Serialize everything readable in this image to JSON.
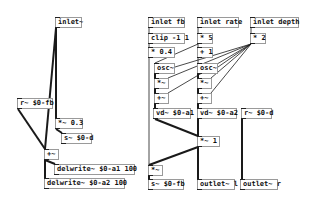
{
  "patch": {
    "objects": [
      {
        "id": "inlet_sig",
        "label": "inlet~",
        "x": 55,
        "y": 17,
        "w": 27
      },
      {
        "id": "r_fb",
        "label": "r~ $0-fb",
        "x": 17,
        "y": 98,
        "w": 36
      },
      {
        "id": "mul_03",
        "label": "*~ 0.3",
        "x": 55,
        "y": 118,
        "w": 28
      },
      {
        "id": "s_d",
        "label": "s~ $0-d",
        "x": 61,
        "y": 133,
        "w": 31
      },
      {
        "id": "add_left",
        "label": "+~",
        "x": 44,
        "y": 149,
        "w": 15
      },
      {
        "id": "delwrite_a1",
        "label": "delwrite~ $0-a1 100",
        "x": 54,
        "y": 164,
        "w": 81
      },
      {
        "id": "delwrite_a2",
        "label": "delwrite~ $0-a2 100",
        "x": 44,
        "y": 178,
        "w": 81
      },
      {
        "id": "inlet_fb",
        "label": "inlet fb",
        "x": 148,
        "y": 17,
        "w": 37
      },
      {
        "id": "clip",
        "label": "clip -1 1",
        "x": 148,
        "y": 33,
        "w": 37
      },
      {
        "id": "mul_04",
        "label": "* 0.4",
        "x": 148,
        "y": 47,
        "w": 27
      },
      {
        "id": "osc_a",
        "label": "osc~",
        "x": 154,
        "y": 63,
        "w": 21
      },
      {
        "id": "mul_a",
        "label": "*~",
        "x": 154,
        "y": 78,
        "w": 15
      },
      {
        "id": "add_a",
        "label": "+~",
        "x": 154,
        "y": 93,
        "w": 15
      },
      {
        "id": "vd_a1",
        "label": "vd~ $0-a1",
        "x": 153,
        "y": 108,
        "w": 38
      },
      {
        "id": "inlet_rate",
        "label": "inlet rate",
        "x": 197,
        "y": 17,
        "w": 42
      },
      {
        "id": "mul_5",
        "label": "* 5",
        "x": 197,
        "y": 33,
        "w": 16
      },
      {
        "id": "add_1",
        "label": "+ 1",
        "x": 197,
        "y": 47,
        "w": 16
      },
      {
        "id": "osc_b",
        "label": "osc~",
        "x": 197,
        "y": 63,
        "w": 21
      },
      {
        "id": "mul_b",
        "label": "*~",
        "x": 197,
        "y": 78,
        "w": 15
      },
      {
        "id": "add_b",
        "label": "+~",
        "x": 197,
        "y": 93,
        "w": 15
      },
      {
        "id": "vd_a2",
        "label": "vd~ $0-a2",
        "x": 197,
        "y": 108,
        "w": 40
      },
      {
        "id": "inlet_depth",
        "label": "inlet depth",
        "x": 250,
        "y": 17,
        "w": 49
      },
      {
        "id": "mul_2",
        "label": "* 2",
        "x": 250,
        "y": 33,
        "w": 16
      },
      {
        "id": "r_d",
        "label": "r~ $0-d",
        "x": 241,
        "y": 108,
        "w": 31
      },
      {
        "id": "mul_1",
        "label": "*~ 1",
        "x": 197,
        "y": 136,
        "w": 23
      },
      {
        "id": "mul_fb",
        "label": "*~",
        "x": 148,
        "y": 165,
        "w": 15
      },
      {
        "id": "s_fb",
        "label": "s~ $0-fb",
        "x": 148,
        "y": 179,
        "w": 36
      },
      {
        "id": "outlet_l",
        "label": "outlet~ l",
        "x": 197,
        "y": 179,
        "w": 38
      },
      {
        "id": "outlet_r",
        "label": "outlet~ r",
        "x": 240,
        "y": 179,
        "w": 38
      }
    ],
    "connections": [
      {
        "from": [
          56,
          28
        ],
        "to": [
          56,
          118
        ],
        "thick": true
      },
      {
        "from": [
          56,
          28
        ],
        "to": [
          45,
          149
        ],
        "thick": true
      },
      {
        "from": [
          18,
          109
        ],
        "to": [
          45,
          149
        ],
        "thick": true
      },
      {
        "from": [
          56,
          129
        ],
        "to": [
          62,
          133
        ],
        "thick": true
      },
      {
        "from": [
          45,
          160
        ],
        "to": [
          55,
          164
        ],
        "thick": true
      },
      {
        "from": [
          45,
          160
        ],
        "to": [
          45,
          178
        ],
        "thick": true
      },
      {
        "from": [
          149,
          28
        ],
        "to": [
          149,
          33
        ],
        "thick": false
      },
      {
        "from": [
          149,
          44
        ],
        "to": [
          149,
          47
        ],
        "thick": false
      },
      {
        "from": [
          149,
          58
        ],
        "to": [
          149,
          165
        ],
        "thick": false
      },
      {
        "from": [
          198,
          28
        ],
        "to": [
          198,
          33
        ],
        "thick": false
      },
      {
        "from": [
          198,
          44
        ],
        "to": [
          155,
          63
        ],
        "thick": false
      },
      {
        "from": [
          198,
          44
        ],
        "to": [
          198,
          47
        ],
        "thick": false
      },
      {
        "from": [
          198,
          58
        ],
        "to": [
          198,
          63
        ],
        "thick": false
      },
      {
        "from": [
          251,
          28
        ],
        "to": [
          251,
          33
        ],
        "thick": false
      },
      {
        "from": [
          251,
          44
        ],
        "to": [
          175,
          67
        ],
        "thick": false
      },
      {
        "from": [
          251,
          44
        ],
        "to": [
          218,
          67
        ],
        "thick": false
      },
      {
        "from": [
          251,
          44
        ],
        "to": [
          168,
          78
        ],
        "thick": false
      },
      {
        "from": [
          251,
          44
        ],
        "to": [
          211,
          78
        ],
        "thick": false
      },
      {
        "from": [
          251,
          44
        ],
        "to": [
          168,
          93
        ],
        "thick": false
      },
      {
        "from": [
          251,
          44
        ],
        "to": [
          211,
          93
        ],
        "thick": false
      },
      {
        "from": [
          155,
          74
        ],
        "to": [
          155,
          78
        ],
        "thick": true
      },
      {
        "from": [
          155,
          89
        ],
        "to": [
          155,
          93
        ],
        "thick": true
      },
      {
        "from": [
          155,
          104
        ],
        "to": [
          155,
          108
        ],
        "thick": true
      },
      {
        "from": [
          198,
          74
        ],
        "to": [
          198,
          78
        ],
        "thick": true
      },
      {
        "from": [
          198,
          89
        ],
        "to": [
          198,
          93
        ],
        "thick": true
      },
      {
        "from": [
          198,
          104
        ],
        "to": [
          198,
          108
        ],
        "thick": true
      },
      {
        "from": [
          155,
          119
        ],
        "to": [
          198,
          136
        ],
        "thick": true
      },
      {
        "from": [
          198,
          119
        ],
        "to": [
          198,
          136
        ],
        "thick": true
      },
      {
        "from": [
          198,
          147
        ],
        "to": [
          149,
          165
        ],
        "thick": true
      },
      {
        "from": [
          198,
          147
        ],
        "to": [
          198,
          179
        ],
        "thick": true
      },
      {
        "from": [
          149,
          176
        ],
        "to": [
          149,
          179
        ],
        "thick": true
      },
      {
        "from": [
          242,
          119
        ],
        "to": [
          242,
          179
        ],
        "thick": true
      }
    ]
  }
}
